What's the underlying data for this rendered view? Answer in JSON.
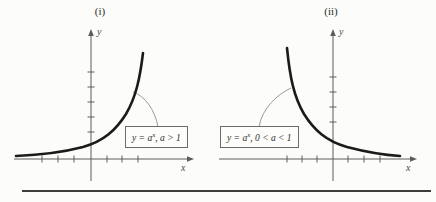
{
  "page": {
    "background": "#fcfcfa",
    "divider_color": "#3c3c3c"
  },
  "colors": {
    "axis": "#5c5c5c",
    "curve": "#1b1b1b",
    "leader": "#8f8f8f",
    "box_border": "#6b6b6b",
    "box_fill": "#fdfdfb"
  },
  "panels": [
    {
      "title": "(i)",
      "x_label": "x",
      "y_label": "y",
      "equation": {
        "pre": "y = a",
        "sup": "x",
        "post": ", a > 1"
      },
      "axes": {
        "origin_x": 91,
        "axis_y": 159,
        "x_start": 14,
        "x_end": 188,
        "y_top": 36,
        "y_bottom": 181,
        "x_ticks": [
          42,
          58,
          74,
          107,
          122,
          138
        ],
        "y_ticks": [
          72,
          87,
          102,
          117,
          132
        ]
      },
      "curve_path": "M 16 156 C 40 155 62 152.5 83 147 C 104 141 116 130 126 114 C 136 97 140 78 143 53",
      "leader_path": "M 133 92 C 145 96 155 110 158 127"
    },
    {
      "title": "(ii)",
      "x_label": "x",
      "y_label": "y",
      "equation": {
        "pre": "y = a",
        "sup": "x",
        "post": ", 0 < a < 1"
      },
      "axes": {
        "origin_x": 333,
        "axis_y": 159,
        "x_start": 219,
        "x_end": 411,
        "y_top": 36,
        "y_bottom": 181,
        "x_ticks": [
          287,
          302,
          317,
          348,
          364,
          380
        ],
        "y_ticks": [
          77,
          92,
          107,
          122
        ]
      },
      "curve_path": "M 287 48 C 290 78 294 97 304 114 C 314 130 326 141 347 147 C 368 152.5 384 155 400 156",
      "leader_path": "M 291 88 C 278 94 262 108 259 127"
    }
  ],
  "divider": {
    "x1": 22,
    "x2": 431,
    "y": 191
  },
  "chart_data": [
    {
      "type": "line",
      "title": "(i)",
      "xlabel": "x",
      "ylabel": "y",
      "grid": false,
      "legend": "none",
      "annotations": [
        "y = a^x, a > 1"
      ],
      "series": [
        {
          "name": "y = a^x, a > 1",
          "x": [
            -3,
            -2,
            -1,
            0,
            1,
            2,
            3
          ],
          "y": [
            0.125,
            0.25,
            0.5,
            1,
            2,
            4,
            8
          ]
        }
      ],
      "description": "Exponential growth curve passing through (0,1); horizontal asymptote y = 0 as x decreases; unlabeled tick marks on both axes."
    },
    {
      "type": "line",
      "title": "(ii)",
      "xlabel": "x",
      "ylabel": "y",
      "grid": false,
      "legend": "none",
      "annotations": [
        "y = a^x, 0 < a < 1"
      ],
      "series": [
        {
          "name": "y = a^x, 0 < a < 1",
          "x": [
            -3,
            -2,
            -1,
            0,
            1,
            2,
            3
          ],
          "y": [
            8,
            4,
            2,
            1,
            0.5,
            0.25,
            0.125
          ]
        }
      ],
      "description": "Exponential decay curve passing through (0,1); horizontal asymptote y = 0 as x increases; unlabeled tick marks on both axes."
    }
  ]
}
